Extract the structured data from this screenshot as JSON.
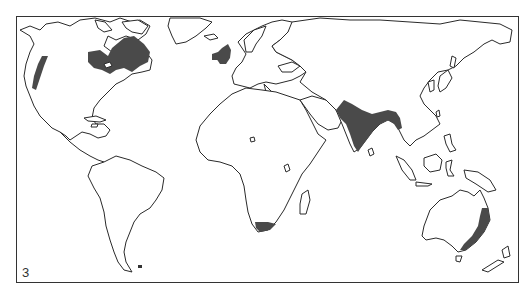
{
  "map": {
    "panel_label": "3",
    "projection": "world outline map",
    "shade_color": "#4a4a4a",
    "outline_color": "#2a2a2a",
    "highlighted_regions": [
      {
        "id": "us-pacific-coast",
        "name": "Western North America coast"
      },
      {
        "id": "eastern-canada",
        "name": "Eastern Canada / Great Lakes"
      },
      {
        "id": "british-isles",
        "name": "British Isles"
      },
      {
        "id": "south-asia",
        "name": "Indian subcontinent"
      },
      {
        "id": "south-africa",
        "name": "Southern tip of Africa"
      },
      {
        "id": "eastern-australia",
        "name": "Eastern Australia coast"
      }
    ]
  }
}
